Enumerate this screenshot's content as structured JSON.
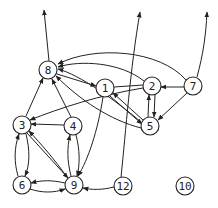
{
  "graph": {
    "type": "directed",
    "nodes": [
      {
        "id": "8",
        "label": "8",
        "x": 48,
        "y": 70
      },
      {
        "id": "1",
        "label": "1",
        "x": 105,
        "y": 88
      },
      {
        "id": "2",
        "label": "2",
        "x": 152,
        "y": 86
      },
      {
        "id": "7",
        "label": "7",
        "x": 193,
        "y": 86
      },
      {
        "id": "5",
        "label": "5",
        "x": 150,
        "y": 126
      },
      {
        "id": "3",
        "label": "3",
        "x": 22,
        "y": 125
      },
      {
        "id": "4",
        "label": "4",
        "x": 73,
        "y": 126
      },
      {
        "id": "6",
        "label": "6",
        "x": 22,
        "y": 185
      },
      {
        "id": "9",
        "label": "9",
        "x": 74,
        "y": 185
      },
      {
        "id": "12",
        "label": "12",
        "x": 123,
        "y": 186
      },
      {
        "id": "10",
        "label": "10",
        "x": 185,
        "y": 186
      }
    ],
    "edges": [
      {
        "from": "8",
        "to": "out-top-left"
      },
      {
        "from": "12",
        "to": "out-top-mid"
      },
      {
        "from": "7",
        "to": "out-top-right"
      },
      {
        "from": "7",
        "to": "8"
      },
      {
        "from": "2",
        "to": "8"
      },
      {
        "from": "5",
        "to": "8"
      },
      {
        "from": "8",
        "to": "1"
      },
      {
        "from": "1",
        "to": "8"
      },
      {
        "from": "7",
        "to": "2"
      },
      {
        "from": "7",
        "to": "5"
      },
      {
        "from": "2",
        "to": "5"
      },
      {
        "from": "5",
        "to": "2"
      },
      {
        "from": "5",
        "to": "1"
      },
      {
        "from": "1",
        "to": "5"
      },
      {
        "from": "1",
        "to": "9"
      },
      {
        "from": "2",
        "to": "3"
      },
      {
        "from": "3",
        "to": "8"
      },
      {
        "from": "4",
        "to": "8"
      },
      {
        "from": "4",
        "to": "3"
      },
      {
        "from": "4",
        "to": "9"
      },
      {
        "from": "9",
        "to": "4"
      },
      {
        "from": "3",
        "to": "9"
      },
      {
        "from": "9",
        "to": "3"
      },
      {
        "from": "3",
        "to": "6"
      },
      {
        "from": "6",
        "to": "3"
      },
      {
        "from": "6",
        "to": "9"
      },
      {
        "from": "9",
        "to": "6"
      },
      {
        "from": "12",
        "to": "9"
      }
    ]
  }
}
